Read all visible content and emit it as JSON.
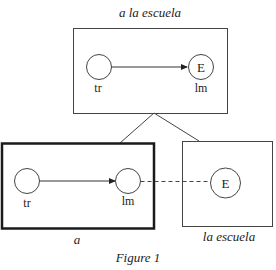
{
  "figure": {
    "caption": "Figure 1",
    "composite": {
      "title": "a la escuela",
      "trajector_label": "tr",
      "landmark_label": "lm",
      "landmark_symbol": "E"
    },
    "component_a": {
      "title": "a",
      "trajector_label": "tr",
      "landmark_label": "lm"
    },
    "component_la_escuela": {
      "title": "la escuela",
      "entity_symbol": "E"
    }
  },
  "colors": {
    "stroke": "#333333",
    "text": "#222222",
    "background": "#ffffff"
  }
}
